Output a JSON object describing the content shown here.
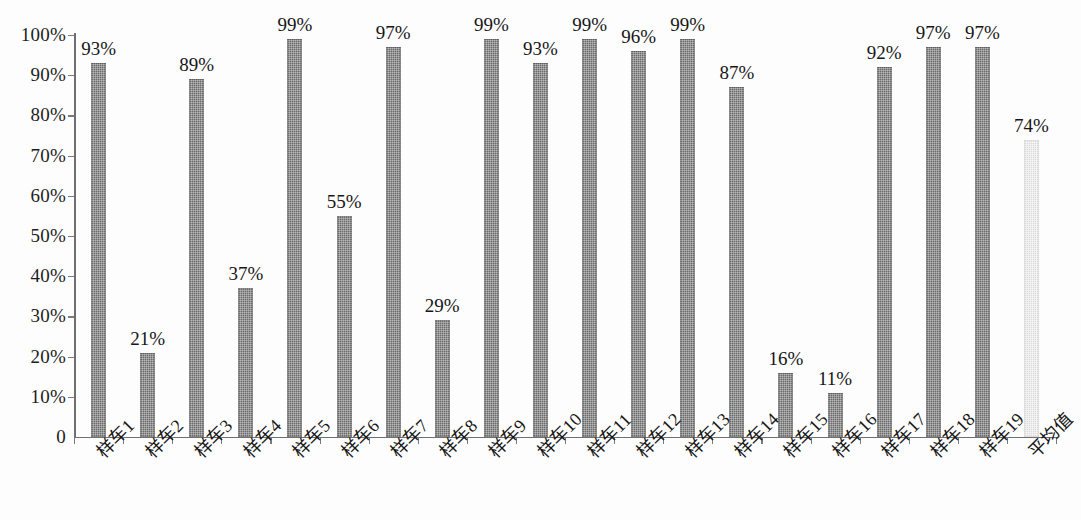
{
  "chart_data": {
    "type": "bar",
    "title": "",
    "xlabel": "",
    "ylabel": "",
    "ylim": [
      0,
      100
    ],
    "grid": false,
    "legend": "none",
    "y_ticks": [
      "0",
      "10%",
      "20%",
      "30%",
      "40%",
      "50%",
      "60%",
      "70%",
      "80%",
      "90%",
      "100%"
    ],
    "y_tick_values": [
      0,
      10,
      20,
      30,
      40,
      50,
      60,
      70,
      80,
      90,
      100
    ],
    "value_suffix": "%",
    "categories": [
      "样车1",
      "样车2",
      "样车3",
      "样车4",
      "样车5",
      "样车6",
      "样车7",
      "样车8",
      "样车9",
      "样车10",
      "样车11",
      "样车12",
      "样车13",
      "样车14",
      "样车15",
      "样车16",
      "样车17",
      "样车18",
      "样车19",
      "平均值"
    ],
    "values": [
      93,
      21,
      89,
      37,
      99,
      55,
      97,
      29,
      99,
      93,
      99,
      96,
      99,
      87,
      16,
      11,
      92,
      97,
      97,
      74
    ],
    "data_labels": [
      "93%",
      "21%",
      "89%",
      "37%",
      "99%",
      "55%",
      "97%",
      "29%",
      "99%",
      "93%",
      "99%",
      "96%",
      "99%",
      "87%",
      "16%",
      "11%",
      "92%",
      "97%",
      "97%",
      "74%"
    ],
    "bar_colors": [
      "#6a6a6a",
      "#6a6a6a",
      "#6a6a6a",
      "#6a6a6a",
      "#6a6a6a",
      "#6a6a6a",
      "#6a6a6a",
      "#6a6a6a",
      "#6a6a6a",
      "#6a6a6a",
      "#6a6a6a",
      "#6a6a6a",
      "#6a6a6a",
      "#6a6a6a",
      "#6a6a6a",
      "#6a6a6a",
      "#6a6a6a",
      "#6a6a6a",
      "#6a6a6a",
      "#d9d9d9"
    ],
    "highlight_index": 19,
    "colors": {
      "bar_primary": "#6a6a6a",
      "bar_average": "#d9d9d9",
      "axis": "#6f6f6f",
      "text": "#161616",
      "background": "#fdfdfd"
    }
  }
}
